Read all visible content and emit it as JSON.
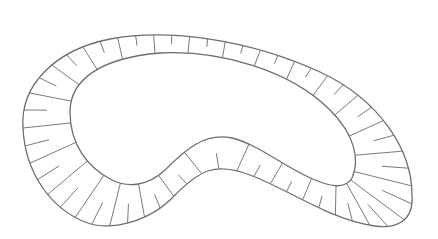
{
  "diagram": {
    "type": "kidney-shaped band with radial tick marks",
    "stroke_color": "#6e6e6e",
    "tick_color": "#7a7a7a",
    "background": "#ffffff",
    "outer_path": "M 23 128 C 20 85, 55 50, 110 39 C 170 28, 250 40, 320 72 C 380 100, 412 150, 412 195 C 414 222, 395 229, 375 226 C 330 220, 290 190, 250 175 C 215 162, 200 170, 175 195 C 150 222, 110 232, 85 222 C 50 208, 25 172, 23 128 Z",
    "inner_path": "M 70 112 C 70 80, 100 58, 160 53 C 220 50, 290 70, 330 110 C 355 135, 360 160, 352 178 C 345 190, 330 186, 315 180 C 285 168, 260 145, 232 138 C 205 132, 185 150, 165 170 C 148 186, 128 188, 112 180 C 88 168, 70 145, 70 112 Z",
    "tick_count": 56,
    "alternate_short_ticks": true,
    "short_tick_ratio": 0.5
  }
}
